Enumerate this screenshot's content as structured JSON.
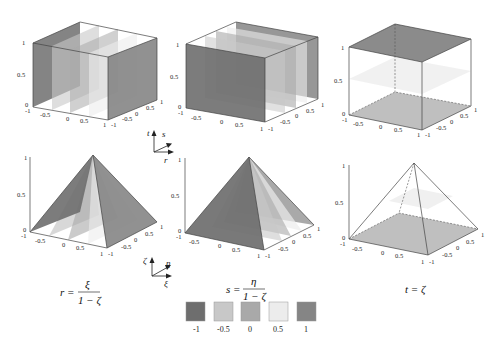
{
  "figure": {
    "colors": {
      "minus_1": "#6e6e6e",
      "minus_0_5": "#c8c8c8",
      "zero": "#a9a9a9",
      "plus_0_5": "#ececec",
      "plus_1": "#858585",
      "edge": "#444444",
      "dashed_edge": "#666666"
    }
  },
  "triads": {
    "top": {
      "up": "t",
      "diag": "s",
      "right": "r"
    },
    "bottom": {
      "up": "ζ",
      "diag": "η",
      "right": "ξ"
    }
  },
  "panels": {
    "cube_r": {
      "title": "r-isosurfaces in cube",
      "z_ticks": [
        "0",
        "0.5",
        "1"
      ],
      "x_ticks": [
        "-1",
        "-0.5",
        "0",
        "0.5",
        "1"
      ],
      "y_ticks": [
        "-1",
        "-0.5",
        "0",
        "0.5",
        "1"
      ]
    },
    "cube_s": {
      "title": "s-isosurfaces in cube",
      "z_ticks": [
        "0",
        "0.5",
        "1"
      ],
      "x_ticks": [
        "-1",
        "-0.5",
        "0",
        "0.5",
        "1"
      ],
      "y_ticks": [
        "-1",
        "-0.5",
        "0",
        "0.5",
        "1"
      ]
    },
    "cube_t": {
      "title": "t-isosurfaces in cube",
      "z_ticks": [
        "0",
        "0.5",
        "1"
      ],
      "x_ticks": [
        "-1",
        "-0.5",
        "0",
        "0.5",
        "1"
      ],
      "y_ticks": [
        "-1",
        "-0.5",
        "0",
        "0.5",
        "1"
      ]
    },
    "pyr_r": {
      "title": "r-isosurfaces in pyramid",
      "z_ticks": [
        "0",
        "0.5",
        "1"
      ],
      "x_ticks": [
        "-1",
        "-0.5",
        "0",
        "0.5",
        "1"
      ],
      "y_ticks": [
        "-1",
        "-0.5",
        "0",
        "0.5",
        "1"
      ]
    },
    "pyr_s": {
      "title": "s-isosurfaces in pyramid",
      "z_ticks": [
        "0",
        "0.5",
        "1"
      ],
      "x_ticks": [
        "-1",
        "-0.5",
        "0",
        "0.5",
        "1"
      ],
      "y_ticks": [
        "-1",
        "-0.5",
        "0",
        "0.5",
        "1"
      ]
    },
    "pyr_t": {
      "title": "t-isosurfaces in pyramid",
      "z_ticks": [
        "0",
        "0.5",
        "1"
      ],
      "x_ticks": [
        "-1",
        "-0.5",
        "0",
        "0.5",
        "1"
      ],
      "y_ticks": [
        "-1",
        "-0.5",
        "0",
        "0.5",
        "1"
      ]
    }
  },
  "equations": {
    "r": {
      "lhs": "r =",
      "num": "ξ",
      "den": "1 − ζ"
    },
    "s": {
      "lhs": "s =",
      "num": "η",
      "den": "1 − ζ"
    },
    "t": {
      "text": "t = ζ"
    }
  },
  "legend": {
    "items": [
      {
        "label": "-1",
        "color": "#6e6e6e"
      },
      {
        "label": "-0.5",
        "color": "#c8c8c8"
      },
      {
        "label": "0",
        "color": "#a9a9a9"
      },
      {
        "label": "0.5",
        "color": "#ececec"
      },
      {
        "label": "1",
        "color": "#858585"
      }
    ]
  }
}
